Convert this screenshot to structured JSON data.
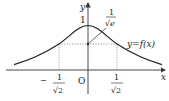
{
  "diagram": {
    "type": "function-graph",
    "function_label": "y=f(x)",
    "axes": {
      "x_label": "x",
      "y_label": "y",
      "origin_label": "O"
    },
    "annotations": {
      "peak_value": "1",
      "inflection_y_num": "1",
      "inflection_y_den": "√e",
      "neg_x_sign": "−",
      "neg_x_num": "1",
      "neg_x_den": "√2",
      "pos_x_num": "1",
      "pos_x_den": "√2"
    },
    "colors": {
      "curve": "#222222",
      "axis": "#333333",
      "guide": "#888888"
    }
  }
}
